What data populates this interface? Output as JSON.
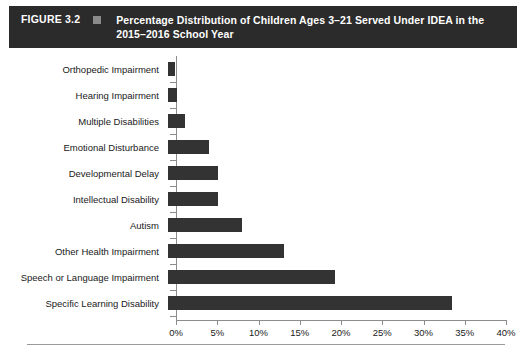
{
  "header": {
    "figure_number": "FIGURE 3.2",
    "marker_icon": "square-marker-icon",
    "marker_color": "#8a8a8a",
    "title": "Percentage Distribution of Children Ages 3–21 Served Under IDEA in the 2015–2016 School Year",
    "background_color": "#2b2b2b",
    "text_color": "#ffffff"
  },
  "chart_data": {
    "type": "bar",
    "orientation": "horizontal",
    "title": "Percentage Distribution of Children Ages 3–21 Served Under IDEA in the 2015–2016 School Year",
    "xlabel": "",
    "ylabel": "",
    "xlim": [
      0,
      40
    ],
    "xtick_labels": [
      "0%",
      "5%",
      "10%",
      "15%",
      "20%",
      "25%",
      "30%",
      "35%",
      "40%"
    ],
    "xtick_values": [
      0,
      5,
      10,
      15,
      20,
      25,
      30,
      35,
      40
    ],
    "grid": false,
    "legend": false,
    "bar_color": "#333333",
    "categories": [
      "Orthopedic Impairment",
      "Hearing Impairment",
      "Multiple Disabilities",
      "Emotional Disturbance",
      "Developmental Delay",
      "Intellectual Disability",
      "Autism",
      "Other Health Impairment",
      "Speech or Language Impairment",
      "Specific Learning Disability"
    ],
    "values": [
      0.9,
      1.1,
      2.0,
      5.0,
      6.0,
      6.1,
      9.0,
      14.1,
      20.2,
      34.4
    ]
  },
  "axis": {
    "line_color": "#8c8c8c"
  },
  "footer": {
    "rule_color": "#9a9a9a"
  }
}
